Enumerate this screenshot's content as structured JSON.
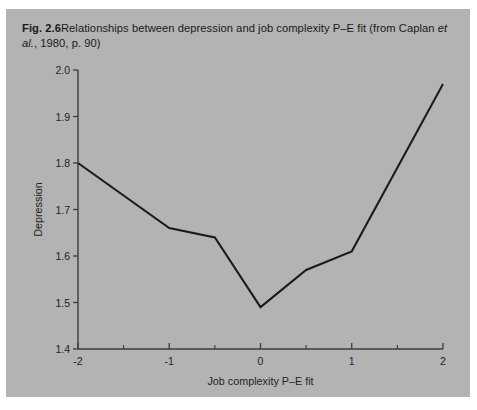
{
  "figure": {
    "label": "Fig. 2.6",
    "caption_part1": "Relationships between depression and job complexity P–E fit (from Caplan ",
    "caption_italic": "et al.",
    "caption_part2": ", 1980, p. 90)",
    "background_color": "#b3b3b3",
    "line_color": "#1a1a1a",
    "axis_color": "#3c3c3c"
  },
  "chart_data": {
    "type": "line",
    "title": "",
    "xlabel": "Job complexity P–E fit",
    "ylabel": "Depression",
    "xlim": [
      -2,
      2
    ],
    "ylim": [
      1.4,
      2.0
    ],
    "xticks": [
      -2,
      -1,
      0,
      1,
      2
    ],
    "xtick_labels": [
      "-2",
      "-1",
      "0",
      "1",
      "2"
    ],
    "xminor_ticks": [
      -1.5,
      -0.5,
      0.5,
      1.5
    ],
    "yticks": [
      1.4,
      1.5,
      1.6,
      1.7,
      1.8,
      1.9,
      2.0
    ],
    "ytick_labels": [
      "1.4",
      "1.5",
      "1.6",
      "1.7",
      "1.8",
      "1.9",
      "2.0"
    ],
    "grid": false,
    "legend": false,
    "x": [
      -2,
      -1,
      -0.5,
      0,
      0.5,
      1,
      2
    ],
    "values": [
      1.8,
      1.66,
      1.64,
      1.49,
      1.57,
      1.61,
      1.97
    ]
  }
}
